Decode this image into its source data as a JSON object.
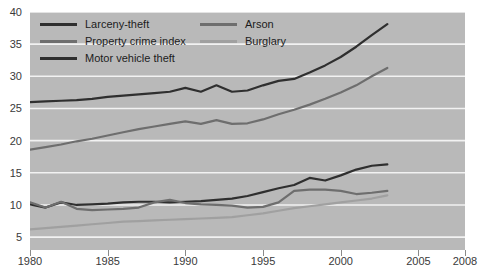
{
  "chart_data": {
    "type": "line",
    "title": "",
    "xlabel": "",
    "ylabel": "",
    "xlim": [
      1980,
      2008
    ],
    "ylim": [
      3,
      40
    ],
    "grid": true,
    "legend_position": "top-left",
    "xticks": [
      1980,
      1985,
      1990,
      1995,
      2000,
      2005,
      2008
    ],
    "yticks": [
      5,
      10,
      15,
      20,
      25,
      30,
      35,
      40
    ],
    "x": [
      1980,
      1981,
      1982,
      1983,
      1984,
      1985,
      1986,
      1987,
      1988,
      1989,
      1990,
      1991,
      1992,
      1993,
      1994,
      1995,
      1996,
      1997,
      1998,
      1999,
      2000,
      2001,
      2002,
      2003
    ],
    "series": [
      {
        "name": "Larceny-theft",
        "color": "#2f2f2f",
        "values": [
          26.0,
          26.1,
          26.2,
          26.3,
          26.5,
          26.8,
          27.0,
          27.2,
          27.4,
          27.6,
          28.2,
          27.6,
          28.6,
          27.6,
          27.8,
          28.6,
          29.3,
          29.6,
          30.6,
          31.7,
          33.0,
          34.6,
          36.4,
          38.1
        ]
      },
      {
        "name": "Property crime index",
        "color": "#6e6e6e",
        "values": [
          18.6,
          19.0,
          19.4,
          19.9,
          20.3,
          20.8,
          21.3,
          21.8,
          22.2,
          22.6,
          23.0,
          22.6,
          23.2,
          22.6,
          22.7,
          23.3,
          24.1,
          24.8,
          25.6,
          26.5,
          27.5,
          28.6,
          30.0,
          31.3
        ]
      },
      {
        "name": "Motor vehicle theft",
        "color": "#2f2f2f",
        "values": [
          10.1,
          9.6,
          10.4,
          10.0,
          10.1,
          10.2,
          10.4,
          10.5,
          10.5,
          10.4,
          10.5,
          10.6,
          10.8,
          11.0,
          11.4,
          12.0,
          12.6,
          13.1,
          14.2,
          13.8,
          14.6,
          15.5,
          16.1,
          16.3
        ]
      },
      {
        "name": "Arson",
        "color": "#6e6e6e",
        "values": [
          10.4,
          9.6,
          10.5,
          9.4,
          9.2,
          9.3,
          9.4,
          9.6,
          10.4,
          10.8,
          10.3,
          10.1,
          10.0,
          9.9,
          9.6,
          9.7,
          10.4,
          12.2,
          12.4,
          12.4,
          12.2,
          11.7,
          11.9,
          12.2
        ]
      },
      {
        "name": "Burglary",
        "color": "#a0a0a0",
        "values": [
          6.2,
          6.4,
          6.6,
          6.8,
          7.0,
          7.2,
          7.4,
          7.5,
          7.6,
          7.7,
          7.8,
          7.9,
          8.0,
          8.1,
          8.4,
          8.7,
          9.1,
          9.5,
          9.8,
          10.1,
          10.4,
          10.7,
          11.0,
          11.5
        ]
      }
    ]
  },
  "legend": {
    "columns": [
      {
        "items": [
          {
            "label": "Larceny-theft",
            "color": "#2f2f2f"
          },
          {
            "label": "Property crime index",
            "color": "#6e6e6e"
          },
          {
            "label": "Motor vehicle theft",
            "color": "#2f2f2f"
          }
        ]
      },
      {
        "items": [
          {
            "label": "Arson",
            "color": "#6e6e6e"
          },
          {
            "label": "Burglary",
            "color": "#a0a0a0"
          }
        ]
      }
    ]
  },
  "style": {
    "plot_background": "#b9b9b9",
    "gridline_color": "#f2f2f2",
    "tick_label_color": "#3a3a3a",
    "page_background": "#ffffff"
  }
}
